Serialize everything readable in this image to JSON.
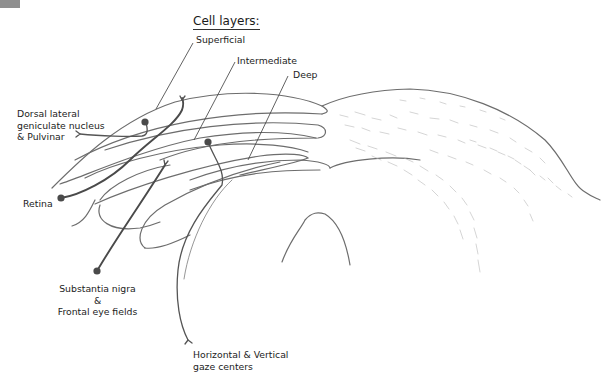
{
  "diagram": {
    "title": "Cell layers:",
    "layers": [
      {
        "label": "Superficial"
      },
      {
        "label": "Intermediate"
      },
      {
        "label": "Deep"
      }
    ],
    "connections": [
      {
        "label_lines": [
          "Dorsal lateral",
          "geniculate nucleus",
          "& Pulvinar"
        ]
      },
      {
        "label": "Retina"
      },
      {
        "label_lines": [
          "Substantia nigra",
          "&",
          "Frontal eye fields"
        ]
      },
      {
        "label_lines": [
          "Horizontal & Vertical",
          "gaze centers"
        ]
      }
    ],
    "colors": {
      "line": "#6d6d6d",
      "fiber": "#4a4a4a",
      "text": "#1c1c1c",
      "background": "#ffffff"
    }
  }
}
